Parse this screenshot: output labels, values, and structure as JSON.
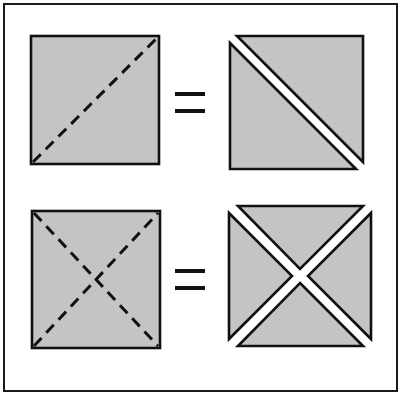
{
  "figure": {
    "title": "Square dissection equivalences",
    "caption": "A square cut along one diagonal equals two triangles; a square cut along both diagonals equals four triangles.",
    "frame": {
      "x": 3,
      "y": 3,
      "width": 395,
      "height": 389,
      "stroke": "#1a1a1a",
      "stroke_width": 2,
      "fill": "#ffffff"
    },
    "colors": {
      "shape_fill": "#c4c4c4",
      "outline": "#111111",
      "background": "#ffffff",
      "dash_color": "#111111",
      "equals_color": "#111111"
    },
    "rows": [
      {
        "id": "row-1",
        "label": "one-diagonal dissection",
        "left": {
          "id": "square-one-diagonal",
          "name": "square with one dashed diagonal",
          "x": 31,
          "y": 36,
          "size": 128,
          "dashes": [
            "main-diagonal"
          ],
          "dash_pattern": "11 7",
          "dash_width": 3
        },
        "operator": {
          "id": "equals-top",
          "symbol": "=",
          "cx": 190,
          "cy": 101,
          "bar_width": 30,
          "bar_height": 4,
          "bar_gap": 13
        },
        "right": {
          "id": "two-triangles",
          "name": "two triangles split along the main diagonal",
          "x": 230,
          "y": 36,
          "size": 133,
          "pieces": 2,
          "gap": 7
        }
      },
      {
        "id": "row-2",
        "label": "two-diagonal dissection",
        "left": {
          "id": "square-two-diagonals",
          "name": "square with two dashed diagonals",
          "x": 32,
          "y": 211,
          "size": 128,
          "dashes": [
            "main-diagonal",
            "anti-diagonal"
          ],
          "dash_pattern": "11 7",
          "dash_width": 3
        },
        "operator": {
          "id": "equals-bottom",
          "symbol": "=",
          "cx": 190,
          "cy": 278,
          "bar_width": 30,
          "bar_height": 4,
          "bar_gap": 13
        },
        "right": {
          "id": "four-triangles",
          "name": "four triangles split along both diagonals",
          "x": 229,
          "y": 206,
          "size": 140,
          "pieces": 4,
          "gap": 7
        }
      }
    ]
  }
}
